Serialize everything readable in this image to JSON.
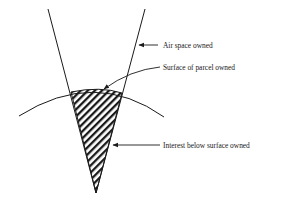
{
  "diagram": {
    "type": "land-ownership-cone",
    "labels": {
      "air_space": "Air space owned",
      "surface": "Surface of parcel owned",
      "subsurface": "Interest below surface owned"
    },
    "colors": {
      "line": "#1a1a1a",
      "background": "#ffffff",
      "hatch": "#1a1a1a"
    }
  }
}
